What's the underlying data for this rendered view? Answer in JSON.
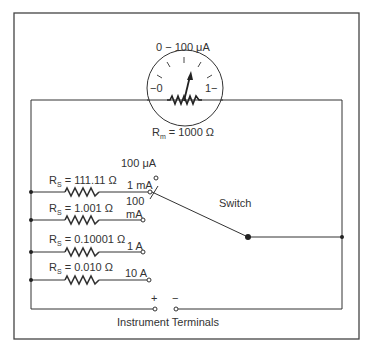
{
  "meter": {
    "range_label": "0 − 100 ",
    "range_unit": "μA",
    "scale_left": "−0",
    "scale_right": "1−",
    "resistance_prefix": "R",
    "resistance_sub": "m",
    "resistance_value": " = 1000 Ω"
  },
  "shunts": [
    {
      "prefix": "R",
      "sub": "S",
      "value": " = 111.11 Ω",
      "range": "1 mA"
    },
    {
      "prefix": "R",
      "sub": "S",
      "value": " = 1.001 Ω",
      "range_line1": "100",
      "range_line2": "mA"
    },
    {
      "prefix": "R",
      "sub": "S",
      "value": " = 0.10001 Ω",
      "range": "1 A"
    },
    {
      "prefix": "R",
      "sub": "S",
      "value": " = 0.010 Ω",
      "range": "10 A"
    }
  ],
  "switch": {
    "label": "Switch",
    "top_position_label": "100 μA"
  },
  "terminals": {
    "plus": "+",
    "minus": "−",
    "label": "Instrument Terminals"
  },
  "colors": {
    "line": "#333333",
    "frame": "#444444"
  }
}
